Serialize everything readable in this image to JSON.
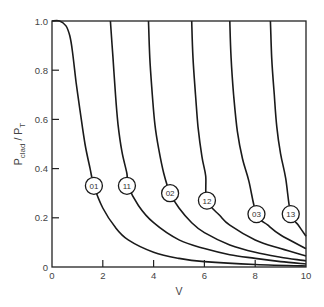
{
  "chart_data": {
    "type": "line",
    "title": "",
    "xlabel": "V",
    "ylabel": "P_clad / P_T",
    "ylabel_parts": {
      "main": "P",
      "sub1": "clad",
      "sep": " / P",
      "sub2": "T"
    },
    "xlim": [
      0,
      10
    ],
    "ylim": [
      0,
      1.0
    ],
    "x_ticks": [
      0,
      2,
      4,
      6,
      8,
      10
    ],
    "x_tick_labels": [
      "0",
      "2",
      "4",
      "6",
      "8",
      "10"
    ],
    "y_ticks": [
      0,
      0.2,
      0.4,
      0.6,
      0.8,
      1.0
    ],
    "y_tick_labels": [
      "0",
      "0.2",
      "0.4",
      "0.6",
      "0.8",
      "1.0"
    ],
    "grid": false,
    "legend": "inline circled labels on curves",
    "series": [
      {
        "name": "01",
        "cutoff_V": 0.0,
        "points": [
          [
            0,
            1.0
          ],
          [
            0.3,
            1.0
          ],
          [
            0.55,
            0.98
          ],
          [
            0.7,
            0.94
          ],
          [
            0.8,
            0.88
          ],
          [
            0.95,
            0.75
          ],
          [
            1.1,
            0.64
          ],
          [
            1.3,
            0.5
          ],
          [
            1.5,
            0.4
          ],
          [
            1.65,
            0.33
          ],
          [
            2.0,
            0.24
          ],
          [
            2.5,
            0.16
          ],
          [
            3.0,
            0.11
          ],
          [
            4.0,
            0.06
          ],
          [
            5.0,
            0.035
          ],
          [
            6.0,
            0.022
          ],
          [
            8.0,
            0.01
          ],
          [
            10.0,
            0.004
          ]
        ],
        "label_at": [
          1.65,
          0.33
        ]
      },
      {
        "name": "11",
        "cutoff_V": 2.3,
        "points": [
          [
            2.3,
            1.0
          ],
          [
            2.4,
            0.85
          ],
          [
            2.5,
            0.7
          ],
          [
            2.6,
            0.58
          ],
          [
            2.75,
            0.47
          ],
          [
            2.95,
            0.38
          ],
          [
            3.0,
            0.33
          ],
          [
            3.4,
            0.25
          ],
          [
            4.0,
            0.18
          ],
          [
            5.0,
            0.11
          ],
          [
            6.0,
            0.075
          ],
          [
            7.0,
            0.05
          ],
          [
            8.0,
            0.035
          ],
          [
            9.0,
            0.022
          ],
          [
            10.0,
            0.012
          ]
        ],
        "label_at": [
          2.95,
          0.33
        ]
      },
      {
        "name": "02",
        "cutoff_V": 3.8,
        "points": [
          [
            3.8,
            1.0
          ],
          [
            3.85,
            0.85
          ],
          [
            3.95,
            0.7
          ],
          [
            4.05,
            0.58
          ],
          [
            4.2,
            0.48
          ],
          [
            4.4,
            0.38
          ],
          [
            4.65,
            0.3
          ],
          [
            5.0,
            0.24
          ],
          [
            5.5,
            0.18
          ],
          [
            6.0,
            0.14
          ],
          [
            7.0,
            0.09
          ],
          [
            8.0,
            0.06
          ],
          [
            9.0,
            0.04
          ],
          [
            10.0,
            0.025
          ]
        ],
        "label_at": [
          4.65,
          0.3
        ]
      },
      {
        "name": "12",
        "cutoff_V": 5.5,
        "points": [
          [
            5.5,
            1.0
          ],
          [
            5.55,
            0.85
          ],
          [
            5.65,
            0.7
          ],
          [
            5.75,
            0.57
          ],
          [
            5.9,
            0.45
          ],
          [
            6.05,
            0.37
          ],
          [
            6.1,
            0.27
          ],
          [
            6.6,
            0.21
          ],
          [
            7.0,
            0.17
          ],
          [
            8.0,
            0.11
          ],
          [
            9.0,
            0.075
          ],
          [
            10.0,
            0.045
          ]
        ],
        "label_at": [
          6.1,
          0.27
        ]
      },
      {
        "name": "03",
        "cutoff_V": 7.0,
        "points": [
          [
            7.0,
            1.0
          ],
          [
            7.05,
            0.85
          ],
          [
            7.15,
            0.7
          ],
          [
            7.3,
            0.55
          ],
          [
            7.5,
            0.44
          ],
          [
            7.75,
            0.35
          ],
          [
            8.05,
            0.215
          ],
          [
            8.5,
            0.17
          ],
          [
            9.0,
            0.13
          ],
          [
            10.0,
            0.075
          ]
        ],
        "label_at": [
          8.05,
          0.215
        ]
      },
      {
        "name": "13",
        "cutoff_V": 8.6,
        "points": [
          [
            8.6,
            1.0
          ],
          [
            8.65,
            0.85
          ],
          [
            8.75,
            0.7
          ],
          [
            8.85,
            0.57
          ],
          [
            9.0,
            0.46
          ],
          [
            9.2,
            0.36
          ],
          [
            9.4,
            0.215
          ],
          [
            9.7,
            0.17
          ],
          [
            10.0,
            0.125
          ]
        ],
        "label_at": [
          9.4,
          0.215
        ]
      }
    ]
  }
}
